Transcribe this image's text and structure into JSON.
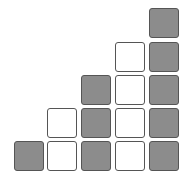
{
  "diagram": {
    "title": "",
    "colors": {
      "filled": "#8c8c8c",
      "empty": "#ffffff",
      "border": "#555555"
    },
    "columns": [
      {
        "index": 0,
        "cells": [
          "filled"
        ]
      },
      {
        "index": 1,
        "cells": [
          "empty",
          "empty"
        ]
      },
      {
        "index": 2,
        "cells": [
          "filled",
          "filled",
          "filled"
        ]
      },
      {
        "index": 3,
        "cells": [
          "empty",
          "empty",
          "empty",
          "empty"
        ]
      },
      {
        "index": 4,
        "cells": [
          "filled",
          "filled",
          "filled",
          "filled",
          "filled"
        ]
      }
    ]
  }
}
